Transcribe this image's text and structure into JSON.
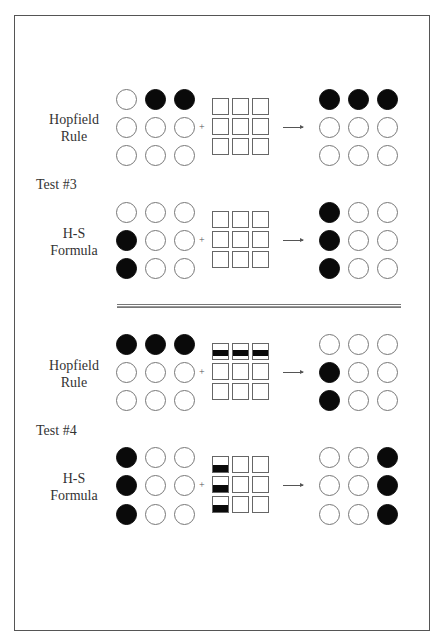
{
  "figure": {
    "frame": {
      "left": 14,
      "top": 15,
      "width": 416,
      "height": 616
    },
    "separator": {
      "position": "between Test #3 and Test #4"
    },
    "tests": [
      {
        "id": "test-3",
        "label": "Test #3",
        "label_y": 176,
        "rows": [
          {
            "rule_label_line1": "Hopfield",
            "rule_label_line2": "Rule",
            "label_y": 112,
            "row_y": [
              99,
              127,
              155
            ],
            "input": [
              [
                0,
                1,
                1
              ],
              [
                0,
                0,
                0
              ],
              [
                0,
                0,
                0
              ]
            ],
            "weights": [
              [
                "empty",
                "empty",
                "empty"
              ],
              [
                "empty",
                "empty",
                "empty"
              ],
              [
                "empty",
                "empty",
                "empty"
              ]
            ],
            "output": [
              [
                1,
                1,
                1
              ],
              [
                0,
                0,
                0
              ],
              [
                0,
                0,
                0
              ]
            ]
          },
          {
            "rule_label_line1": "H-S",
            "rule_label_line2": "Formula",
            "label_y": 226,
            "row_y": [
              212,
              240,
              268
            ],
            "input": [
              [
                0,
                0,
                0
              ],
              [
                1,
                0,
                0
              ],
              [
                1,
                0,
                0
              ]
            ],
            "weights": [
              [
                "empty",
                "empty",
                "empty"
              ],
              [
                "empty",
                "empty",
                "empty"
              ],
              [
                "empty",
                "empty",
                "empty"
              ]
            ],
            "output": [
              [
                1,
                0,
                0
              ],
              [
                1,
                0,
                0
              ],
              [
                1,
                0,
                0
              ]
            ]
          }
        ]
      },
      {
        "id": "test-4",
        "label": "Test #4",
        "label_y": 422,
        "rows": [
          {
            "rule_label_line1": "Hopfield",
            "rule_label_line2": "Rule",
            "label_y": 358,
            "row_y": [
              344,
              372,
              400
            ],
            "input": [
              [
                1,
                1,
                1
              ],
              [
                0,
                0,
                0
              ],
              [
                0,
                0,
                0
              ]
            ],
            "weights": [
              [
                "mid-bar",
                "mid-bar",
                "mid-bar"
              ],
              [
                "empty",
                "empty",
                "empty"
              ],
              [
                "empty",
                "empty",
                "empty"
              ]
            ],
            "output": [
              [
                0,
                0,
                0
              ],
              [
                1,
                0,
                0
              ],
              [
                1,
                0,
                0
              ]
            ]
          },
          {
            "rule_label_line1": "H-S",
            "rule_label_line2": "Formula",
            "label_y": 471,
            "row_y": [
              457,
              485,
              514
            ],
            "input": [
              [
                1,
                0,
                0
              ],
              [
                1,
                0,
                0
              ],
              [
                1,
                0,
                0
              ]
            ],
            "weights": [
              [
                "bottom-bar",
                "empty",
                "empty"
              ],
              [
                "bottom-bar",
                "empty",
                "empty"
              ],
              [
                "bottom-bar",
                "empty",
                "empty"
              ]
            ],
            "output": [
              [
                0,
                0,
                1
              ],
              [
                0,
                0,
                1
              ],
              [
                0,
                0,
                1
              ]
            ]
          }
        ]
      }
    ],
    "symbols": {
      "plus": "+",
      "arrow": "→"
    },
    "colors": {
      "filled": "#0a0a0a",
      "outline": "#777777",
      "frame": "#555555",
      "background": "#ffffff"
    }
  }
}
